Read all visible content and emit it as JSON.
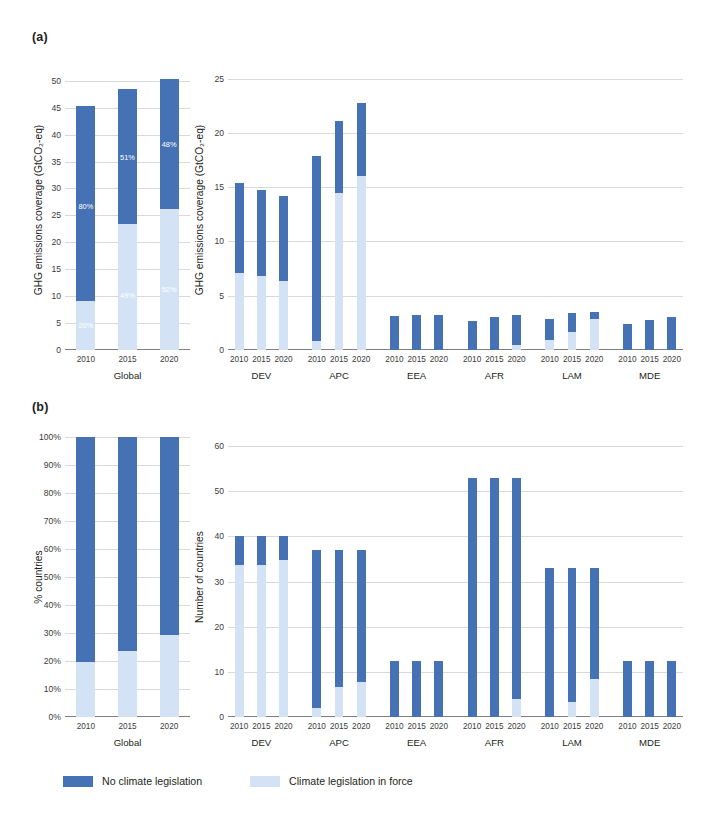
{
  "figure": {
    "panels": [
      {
        "key": "a",
        "label": "(a)"
      },
      {
        "key": "b",
        "label": "(b)"
      }
    ]
  },
  "legend": {
    "items": [
      {
        "label": "No climate legislation",
        "color": "#4472b4",
        "name": "no-climate-legislation"
      },
      {
        "label": "Climate legislation in force",
        "color": "#d3e3f5",
        "name": "climate-legislation-in-force"
      }
    ]
  },
  "colors": {
    "dark_blue": "#4472b4",
    "light_blue": "#d3e3f5",
    "gridline": "#d9d9d9",
    "axis": "#7f7f7f",
    "text": "#231f20"
  },
  "chart_data": [
    {
      "id": "a-global",
      "type": "bar",
      "stacked": true,
      "panel": "(a)",
      "title": "",
      "xlabel": "Global",
      "ylabel": "GHG emissions coverage (GtCO₂-eq)",
      "ylim": [
        0,
        52
      ],
      "yticks": [
        0,
        5,
        10,
        15,
        20,
        25,
        30,
        35,
        40,
        45,
        50
      ],
      "ytick_labels": [
        "0",
        "5",
        "10",
        "15",
        "20",
        "25",
        "30",
        "35",
        "40",
        "45",
        "50"
      ],
      "grid": true,
      "categories": [
        "2010",
        "2015",
        "2020"
      ],
      "series": [
        {
          "name": "Climate legislation in force",
          "color": "#d3e3f5",
          "values": [
            9.1,
            23.4,
            26.2
          ]
        },
        {
          "name": "No climate legislation",
          "color": "#4472b4",
          "values": [
            36.3,
            25.0,
            24.1
          ]
        }
      ],
      "totals": [
        45.4,
        48.4,
        50.3
      ],
      "annotations": [
        {
          "category": "2010",
          "segment": "dark",
          "text": "80%"
        },
        {
          "category": "2010",
          "segment": "light",
          "text": "20%"
        },
        {
          "category": "2015",
          "segment": "dark",
          "text": "51%"
        },
        {
          "category": "2015",
          "segment": "light",
          "text": "49%"
        },
        {
          "category": "2020",
          "segment": "dark",
          "text": "48%"
        },
        {
          "category": "2020",
          "segment": "light",
          "text": "52%"
        }
      ]
    },
    {
      "id": "a-regions",
      "type": "bar",
      "stacked": true,
      "panel": "(a)",
      "title": "",
      "xlabel": "",
      "ylabel": "GHG emissions coverage (GtCO₂-eq)",
      "ylim": [
        0,
        25.8
      ],
      "yticks": [
        0,
        5,
        10,
        15,
        20,
        25
      ],
      "ytick_labels": [
        "0",
        "5",
        "10",
        "15",
        "20",
        "25"
      ],
      "grid": true,
      "groups": [
        "DEV",
        "APC",
        "EEA",
        "AFR",
        "LAM",
        "MDE"
      ],
      "categories": [
        "2010",
        "2015",
        "2020"
      ],
      "bars": [
        {
          "group": "DEV",
          "year": "2010",
          "light": 7.1,
          "total": 15.4
        },
        {
          "group": "DEV",
          "year": "2015",
          "light": 6.8,
          "total": 14.7
        },
        {
          "group": "DEV",
          "year": "2020",
          "light": 6.4,
          "total": 14.2
        },
        {
          "group": "APC",
          "year": "2010",
          "light": 0.8,
          "total": 17.9
        },
        {
          "group": "APC",
          "year": "2015",
          "light": 14.5,
          "total": 21.1
        },
        {
          "group": "APC",
          "year": "2020",
          "light": 16.0,
          "total": 22.8
        },
        {
          "group": "EEA",
          "year": "2010",
          "light": 0.0,
          "total": 3.1
        },
        {
          "group": "EEA",
          "year": "2015",
          "light": 0.0,
          "total": 3.2
        },
        {
          "group": "EEA",
          "year": "2020",
          "light": 0.0,
          "total": 3.2
        },
        {
          "group": "AFR",
          "year": "2010",
          "light": 0.0,
          "total": 2.7
        },
        {
          "group": "AFR",
          "year": "2015",
          "light": 0.0,
          "total": 3.0
        },
        {
          "group": "AFR",
          "year": "2020",
          "light": 0.5,
          "total": 3.2
        },
        {
          "group": "LAM",
          "year": "2010",
          "light": 0.9,
          "total": 2.9
        },
        {
          "group": "LAM",
          "year": "2015",
          "light": 1.7,
          "total": 3.4
        },
        {
          "group": "LAM",
          "year": "2020",
          "light": 2.9,
          "total": 3.5
        },
        {
          "group": "MDE",
          "year": "2010",
          "light": 0.0,
          "total": 2.4
        },
        {
          "group": "MDE",
          "year": "2015",
          "light": 0.0,
          "total": 2.8
        },
        {
          "group": "MDE",
          "year": "2020",
          "light": 0.0,
          "total": 3.0
        }
      ]
    },
    {
      "id": "b-global",
      "type": "bar",
      "stacked": true,
      "panel": "(b)",
      "title": "",
      "xlabel": "Global",
      "ylabel": "% countries",
      "ylim": [
        0,
        100
      ],
      "yticks": [
        0,
        10,
        20,
        30,
        40,
        50,
        60,
        70,
        80,
        90,
        100
      ],
      "ytick_labels": [
        "0%",
        "10%",
        "20%",
        "30%",
        "40%",
        "50%",
        "60%",
        "70%",
        "80%",
        "90%",
        "100%"
      ],
      "grid": true,
      "categories": [
        "2010",
        "2015",
        "2020"
      ],
      "series": [
        {
          "name": "Climate legislation in force",
          "color": "#d3e3f5",
          "values": [
            19.8,
            23.5,
            29.4
          ]
        },
        {
          "name": "No climate legislation",
          "color": "#4472b4",
          "values": [
            80.2,
            76.5,
            70.6
          ]
        }
      ],
      "totals": [
        100,
        100,
        100
      ]
    },
    {
      "id": "b-regions",
      "type": "bar",
      "stacked": true,
      "panel": "(b)",
      "title": "",
      "xlabel": "",
      "ylabel": "Number of countries",
      "ylim": [
        0,
        62
      ],
      "yticks": [
        0,
        10,
        20,
        30,
        40,
        50,
        60
      ],
      "ytick_labels": [
        "0",
        "10",
        "20",
        "30",
        "40",
        "50",
        "60"
      ],
      "grid": true,
      "groups": [
        "DEV",
        "APC",
        "EEA",
        "AFR",
        "LAM",
        "MDE"
      ],
      "categories": [
        "2010",
        "2015",
        "2020"
      ],
      "bars": [
        {
          "group": "DEV",
          "year": "2010",
          "light": 33.7,
          "total": 40
        },
        {
          "group": "DEV",
          "year": "2015",
          "light": 33.7,
          "total": 40
        },
        {
          "group": "DEV",
          "year": "2020",
          "light": 34.8,
          "total": 40
        },
        {
          "group": "APC",
          "year": "2010",
          "light": 1.9,
          "total": 37
        },
        {
          "group": "APC",
          "year": "2015",
          "light": 6.7,
          "total": 37
        },
        {
          "group": "APC",
          "year": "2020",
          "light": 7.7,
          "total": 37
        },
        {
          "group": "EEA",
          "year": "2010",
          "light": 0,
          "total": 12.5
        },
        {
          "group": "EEA",
          "year": "2015",
          "light": 0,
          "total": 12.5
        },
        {
          "group": "EEA",
          "year": "2020",
          "light": 0,
          "total": 12.5
        },
        {
          "group": "AFR",
          "year": "2010",
          "light": 0,
          "total": 53
        },
        {
          "group": "AFR",
          "year": "2015",
          "light": 0,
          "total": 53
        },
        {
          "group": "AFR",
          "year": "2020",
          "light": 4.0,
          "total": 53
        },
        {
          "group": "LAM",
          "year": "2010",
          "light": 0,
          "total": 33
        },
        {
          "group": "LAM",
          "year": "2015",
          "light": 3.3,
          "total": 33
        },
        {
          "group": "LAM",
          "year": "2020",
          "light": 8.5,
          "total": 33
        },
        {
          "group": "MDE",
          "year": "2010",
          "light": 0,
          "total": 12.5
        },
        {
          "group": "MDE",
          "year": "2015",
          "light": 0,
          "total": 12.5
        },
        {
          "group": "MDE",
          "year": "2020",
          "light": 0,
          "total": 12.5
        }
      ]
    }
  ]
}
